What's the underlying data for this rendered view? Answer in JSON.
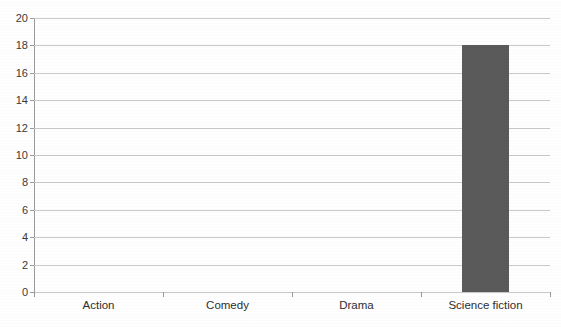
{
  "chart_data": {
    "type": "bar",
    "title": "",
    "xlabel": "",
    "ylabel": "",
    "categories": [
      "Action",
      "Comedy",
      "Drama",
      "Science fiction"
    ],
    "values": [
      0,
      0,
      0,
      18
    ],
    "ylim": [
      0,
      20
    ],
    "ytick_step": 2,
    "yticks": [
      0,
      2,
      4,
      6,
      8,
      10,
      12,
      14,
      16,
      18,
      20
    ],
    "ytick_labels": [
      "0",
      "2",
      "4",
      "6",
      "8",
      "10",
      "12",
      "14",
      "16",
      "18",
      "20"
    ],
    "grid": true,
    "legend": false,
    "bar_color": "#5a5a5a",
    "gridline_color": "#c9c9c9",
    "axis_color": "#9a9a9a",
    "background_color": "#fefefe"
  }
}
